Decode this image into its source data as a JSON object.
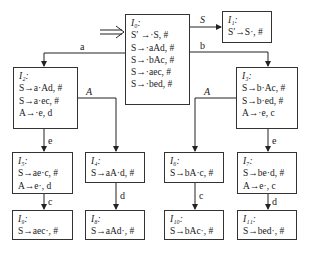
{
  "diagram": {
    "type": "LR(1) item-set automaton",
    "start_marker": "⇒",
    "states": [
      {
        "id": "I0",
        "title": "I₀:",
        "items": [
          "S′ →·S, #",
          "S→·aAd, #",
          "S→·bAc, #",
          "S→·aec, #",
          "S→·bed, #"
        ]
      },
      {
        "id": "I1",
        "title": "I₁:",
        "items": [
          "S′→S·, #"
        ]
      },
      {
        "id": "I2",
        "title": "I₂:",
        "items": [
          "S→a·Ad, #",
          "S→a·ec, #",
          "A→·e, d"
        ]
      },
      {
        "id": "I3",
        "title": "I₃:",
        "items": [
          "S→b·Ac, #",
          "S→b·ed, #",
          "A→·e, c"
        ]
      },
      {
        "id": "I4",
        "title": "I₄:",
        "items": [
          "S→aA·d, #"
        ]
      },
      {
        "id": "I5",
        "title": "I₅:",
        "items": [
          "S→ae·c, #",
          "A→e·, d"
        ]
      },
      {
        "id": "I6",
        "title": "I₆:",
        "items": [
          "S→bA·c, #"
        ]
      },
      {
        "id": "I7",
        "title": "I₇:",
        "items": [
          "S→be·d, #",
          "A→e·, c"
        ]
      },
      {
        "id": "I8",
        "title": "I₈:",
        "items": [
          "S→aAd·, #"
        ]
      },
      {
        "id": "I9",
        "title": "I₉:",
        "items": [
          "S→aec·, #"
        ]
      },
      {
        "id": "I10",
        "title": "I₁₀:",
        "items": [
          "S→bAc·, #"
        ]
      },
      {
        "id": "I11",
        "title": "I₁₁:",
        "items": [
          "S→bed·, #"
        ]
      }
    ],
    "transitions": [
      {
        "from": "I0",
        "to": "I1",
        "label": "S"
      },
      {
        "from": "I0",
        "to": "I2",
        "label": "a"
      },
      {
        "from": "I0",
        "to": "I3",
        "label": "b"
      },
      {
        "from": "I2",
        "to": "I4",
        "label": "A"
      },
      {
        "from": "I2",
        "to": "I5",
        "label": "e"
      },
      {
        "from": "I3",
        "to": "I6",
        "label": "A"
      },
      {
        "from": "I3",
        "to": "I7",
        "label": "e"
      },
      {
        "from": "I4",
        "to": "I8",
        "label": "d"
      },
      {
        "from": "I5",
        "to": "I9",
        "label": "c"
      },
      {
        "from": "I6",
        "to": "I10",
        "label": "c"
      },
      {
        "from": "I7",
        "to": "I11",
        "label": "d"
      }
    ]
  }
}
